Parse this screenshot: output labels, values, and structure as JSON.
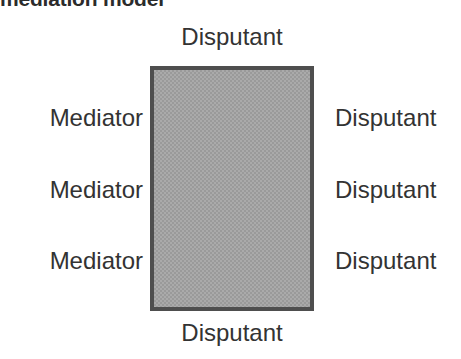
{
  "figure": {
    "title": "mediation model",
    "title_clipped": true,
    "box": {
      "fill_color": "#aaaaaa",
      "border_color": "#4e4e4e",
      "pattern": "checkerboard-dither-50"
    },
    "text_color": "#333333",
    "background_color": "#ffffff"
  },
  "labels": {
    "top": "Disputant",
    "bottom": "Disputant",
    "left": [
      {
        "text": "Mediator"
      },
      {
        "text": "Mediator"
      },
      {
        "text": "Mediator"
      }
    ],
    "right": [
      {
        "text": "Disputant"
      },
      {
        "text": "Disputant"
      },
      {
        "text": "Disputant"
      }
    ]
  }
}
